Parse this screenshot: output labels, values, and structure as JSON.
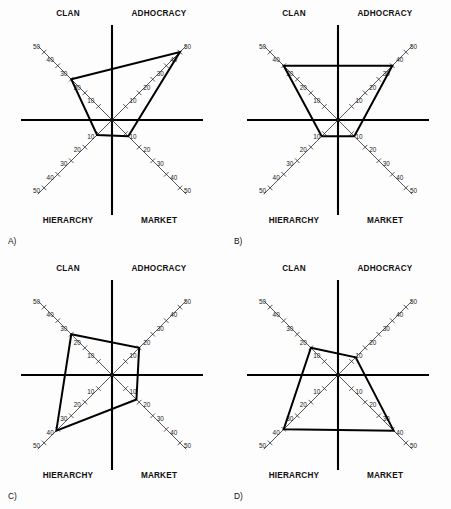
{
  "figure": {
    "background": "#fdfdfd",
    "ink": "#000000",
    "panel_count": 4
  },
  "quadrant_labels": {
    "top_left": "CLAN",
    "top_right": "ADHOCRACY",
    "bottom_left": "HIERARCHY",
    "bottom_right": "MARKET"
  },
  "tick_labels": [
    "10",
    "20",
    "30",
    "40",
    "50"
  ],
  "panels": [
    {
      "letter": "A)",
      "name": "panel-a"
    },
    {
      "letter": "B)",
      "name": "panel-b"
    },
    {
      "letter": "C)",
      "name": "panel-c"
    },
    {
      "letter": "D)",
      "name": "panel-d"
    }
  ],
  "chart_data": [
    {
      "type": "radar",
      "title": "A)",
      "categories": [
        "CLAN",
        "ADHOCRACY",
        "MARKET",
        "HIERARCHY"
      ],
      "axis_directions": [
        "up-left",
        "up-right",
        "down-right",
        "down-left"
      ],
      "values": [
        30,
        50,
        12,
        11
      ],
      "rlim": [
        0,
        50
      ],
      "tick_values": [
        10,
        20,
        30,
        40,
        50
      ],
      "grid": false,
      "legend": "none"
    },
    {
      "type": "radar",
      "title": "B)",
      "categories": [
        "CLAN",
        "ADHOCRACY",
        "MARKET",
        "HIERARCHY"
      ],
      "axis_directions": [
        "up-left",
        "up-right",
        "down-right",
        "down-left"
      ],
      "values": [
        40,
        40,
        12,
        12
      ],
      "rlim": [
        0,
        50
      ],
      "tick_values": [
        10,
        20,
        30,
        40,
        50
      ],
      "grid": false,
      "legend": "none"
    },
    {
      "type": "radar",
      "title": "C)",
      "categories": [
        "CLAN",
        "ADHOCRACY",
        "MARKET",
        "HIERARCHY"
      ],
      "axis_directions": [
        "up-left",
        "up-right",
        "down-right",
        "down-left"
      ],
      "values": [
        30,
        20,
        18,
        41
      ],
      "rlim": [
        0,
        50
      ],
      "tick_values": [
        10,
        20,
        30,
        40,
        50
      ],
      "grid": false,
      "legend": "none"
    },
    {
      "type": "radar",
      "title": "D)",
      "categories": [
        "CLAN",
        "ADHOCRACY",
        "MARKET",
        "HIERARCHY"
      ],
      "axis_directions": [
        "up-left",
        "up-right",
        "down-right",
        "down-left"
      ],
      "values": [
        20,
        13,
        41,
        40
      ],
      "rlim": [
        0,
        50
      ],
      "tick_values": [
        10,
        20,
        30,
        40,
        50
      ],
      "grid": false,
      "legend": "none"
    }
  ]
}
